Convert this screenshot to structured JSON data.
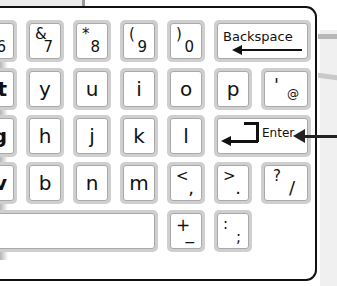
{
  "keyboard": {
    "row1": [
      {
        "id": "key-6",
        "shift": "",
        "base": "6",
        "partial": true
      },
      {
        "id": "key-7",
        "shift": "&",
        "base": "7"
      },
      {
        "id": "key-8",
        "shift": "*",
        "base": "8"
      },
      {
        "id": "key-9",
        "shift": "(",
        "base": "9"
      },
      {
        "id": "key-0",
        "shift": ")",
        "base": "0"
      },
      {
        "id": "key-backspace",
        "label": "Backspace",
        "icon": "arrow-left-icon"
      }
    ],
    "row2": [
      {
        "id": "key-t",
        "main": "t",
        "partial": true
      },
      {
        "id": "key-y",
        "main": "y"
      },
      {
        "id": "key-u",
        "main": "u"
      },
      {
        "id": "key-i",
        "main": "i"
      },
      {
        "id": "key-o",
        "main": "o"
      },
      {
        "id": "key-p",
        "main": "p"
      },
      {
        "id": "key-apostrophe",
        "shift": "'",
        "base": "@"
      }
    ],
    "row3": [
      {
        "id": "key-g",
        "main": "g",
        "partial": true
      },
      {
        "id": "key-h",
        "main": "h"
      },
      {
        "id": "key-j",
        "main": "j"
      },
      {
        "id": "key-k",
        "main": "k"
      },
      {
        "id": "key-l",
        "main": "l"
      },
      {
        "id": "key-enter",
        "label": "Enter",
        "icon": "enter-return-icon"
      }
    ],
    "row4": [
      {
        "id": "key-v",
        "main": "v",
        "partial": true
      },
      {
        "id": "key-b",
        "main": "b"
      },
      {
        "id": "key-n",
        "main": "n"
      },
      {
        "id": "key-m",
        "main": "m"
      },
      {
        "id": "key-comma",
        "shift": "<",
        "base": ","
      },
      {
        "id": "key-period",
        "shift": ">",
        "base": "."
      },
      {
        "id": "key-slash",
        "shift": "?",
        "base": "/"
      }
    ],
    "row5": [
      {
        "id": "key-space",
        "label": ""
      },
      {
        "id": "key-plus",
        "shift": "+",
        "base": "_"
      },
      {
        "id": "key-colon",
        "shift": ":",
        "base": ";"
      }
    ]
  },
  "annotation": {
    "pointer": "arrow-pointing-to-enter"
  }
}
